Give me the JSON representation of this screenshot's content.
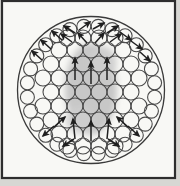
{
  "figure": {
    "canvas": {
      "width": 180,
      "height": 186
    },
    "colors": {
      "mat": "#d7d7d3",
      "paper": "#f8f8f5",
      "frame_line": "#2e2e2e",
      "big_circle_line": "#3a3a3a",
      "wire_line": "#4a4a4a",
      "arrow": "#1f1f1f",
      "core_shade": "#c4c4c4",
      "core_shade_edge": "#cecece"
    },
    "frame": {
      "x": 2,
      "y": 1,
      "w": 173,
      "h": 177,
      "stroke_width": 2.2
    },
    "outer_circle": {
      "cx": 91,
      "cy": 90,
      "r": 73.5,
      "stroke_width": 1.3
    },
    "shaded_core": {
      "blobs": [
        {
          "cx": 91,
          "cy": 89,
          "rx": 26,
          "ry": 46
        },
        {
          "cx": 103,
          "cy": 62,
          "rx": 14,
          "ry": 16
        },
        {
          "cx": 80,
          "cy": 120,
          "rx": 14,
          "ry": 14
        }
      ],
      "blur": 3
    },
    "ring": {
      "count": 28,
      "radius": 64,
      "circle_r": 7,
      "stroke_width": 1.1,
      "half_step_offset": true
    },
    "cluster": {
      "circle_r": 8,
      "stroke_width": 1.1,
      "rows": [
        {
          "y": 38,
          "xs": [
            67,
            83,
            99,
            115
          ]
        },
        {
          "y": 50,
          "xs": [
            59,
            75,
            91,
            107,
            123
          ]
        },
        {
          "y": 64,
          "xs": [
            51,
            67,
            83,
            99,
            115,
            131
          ]
        },
        {
          "y": 78,
          "xs": [
            43,
            59,
            75,
            91,
            107,
            123,
            139
          ]
        },
        {
          "y": 92,
          "xs": [
            51,
            67,
            83,
            99,
            115,
            131
          ]
        },
        {
          "y": 106,
          "xs": [
            43,
            59,
            75,
            91,
            107,
            123,
            139
          ]
        },
        {
          "y": 120,
          "xs": [
            51,
            67,
            83,
            99,
            115,
            131
          ]
        },
        {
          "y": 134,
          "xs": [
            59,
            75,
            91,
            107,
            123
          ]
        },
        {
          "y": 146,
          "xs": [
            67,
            83,
            99,
            115
          ]
        }
      ]
    },
    "arrows": {
      "stroke_width": 1.5,
      "segments": [
        {
          "x1": 42,
          "y1": 60,
          "x2": 32,
          "y2": 51
        },
        {
          "x1": 51,
          "y1": 49,
          "x2": 41,
          "y2": 40
        },
        {
          "x1": 62,
          "y1": 40,
          "x2": 52,
          "y2": 31
        },
        {
          "x1": 75,
          "y1": 33,
          "x2": 64,
          "y2": 26
        },
        {
          "x1": 79,
          "y1": 30,
          "x2": 90,
          "y2": 22
        },
        {
          "x1": 93,
          "y1": 29,
          "x2": 104,
          "y2": 23
        },
        {
          "x1": 107,
          "y1": 33,
          "x2": 118,
          "y2": 26
        },
        {
          "x1": 120,
          "y1": 32,
          "x2": 131,
          "y2": 40
        },
        {
          "x1": 131,
          "y1": 41,
          "x2": 142,
          "y2": 49
        },
        {
          "x1": 140,
          "y1": 52,
          "x2": 150,
          "y2": 61
        },
        {
          "x1": 72,
          "y1": 42,
          "x2": 61,
          "y2": 34
        },
        {
          "x1": 87,
          "y1": 43,
          "x2": 78,
          "y2": 33
        },
        {
          "x1": 95,
          "y1": 43,
          "x2": 104,
          "y2": 33
        },
        {
          "x1": 110,
          "y1": 42,
          "x2": 121,
          "y2": 34
        },
        {
          "x1": 75,
          "y1": 80,
          "x2": 75,
          "y2": 58
        },
        {
          "x1": 91,
          "y1": 84,
          "x2": 91,
          "y2": 62
        },
        {
          "x1": 107,
          "y1": 80,
          "x2": 107,
          "y2": 58
        },
        {
          "x1": 75,
          "y1": 139,
          "x2": 73,
          "y2": 119
        },
        {
          "x1": 91,
          "y1": 141,
          "x2": 91,
          "y2": 121
        },
        {
          "x1": 107,
          "y1": 139,
          "x2": 109,
          "y2": 119
        },
        {
          "x1": 54,
          "y1": 127,
          "x2": 65,
          "y2": 117
        },
        {
          "x1": 128,
          "y1": 127,
          "x2": 117,
          "y2": 117
        },
        {
          "x1": 54,
          "y1": 126,
          "x2": 43,
          "y2": 136
        },
        {
          "x1": 128,
          "y1": 126,
          "x2": 139,
          "y2": 136
        },
        {
          "x1": 74,
          "y1": 139,
          "x2": 63,
          "y2": 146
        },
        {
          "x1": 108,
          "y1": 139,
          "x2": 119,
          "y2": 146
        }
      ]
    }
  }
}
